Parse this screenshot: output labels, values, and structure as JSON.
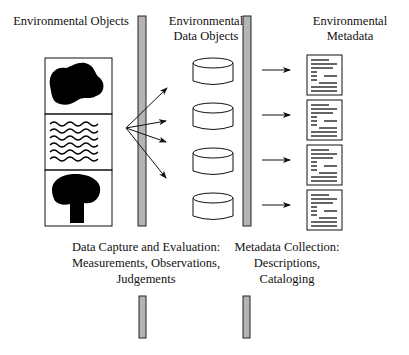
{
  "headings": {
    "objects": "Environmental Objects",
    "data_objects_line1": "Environmental",
    "data_objects_line2": "Data Objects",
    "metadata_line1": "Environmental",
    "metadata_line2": "Metadata"
  },
  "processes": {
    "capture_line1": "Data Capture and Evaluation:",
    "capture_line2": "Measurements, Observations,",
    "capture_line3": "Judgements",
    "metadata_line1": "Metadata Collection:",
    "metadata_line2": "Descriptions,",
    "metadata_line3": "Cataloging"
  },
  "object_icons": [
    "blob-shape",
    "wave-lines",
    "tree-shape"
  ],
  "data_object_count": 4,
  "metadata_doc_count": 4,
  "colors": {
    "bar_fill": "#b4b4b4",
    "line": "#111111"
  }
}
